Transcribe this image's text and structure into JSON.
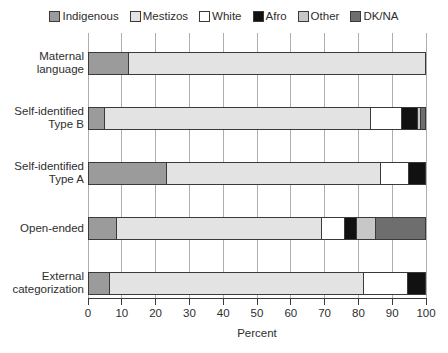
{
  "chart_data": {
    "type": "bar",
    "orientation": "horizontal",
    "stacked": true,
    "grid": "vertical",
    "legend_position": "top",
    "title": "",
    "xlabel": "Percent",
    "xlim": [
      0,
      100
    ],
    "xticks": [
      0,
      10,
      20,
      30,
      40,
      50,
      60,
      70,
      80,
      90,
      100
    ],
    "categories": [
      "Maternal\nlanguage",
      "Self-identified\nType B",
      "Self-identified\nType A",
      "Open-ended",
      "External\ncategorization"
    ],
    "series": [
      {
        "name": "Indigenous",
        "color": "#9b9b9b",
        "values": [
          11.5,
          4.5,
          23,
          8,
          6
        ]
      },
      {
        "name": "Mestizos",
        "color": "#e3e3e3",
        "values": [
          88.5,
          79,
          63.5,
          61,
          75.5
        ]
      },
      {
        "name": "White",
        "color": "#ffffff",
        "values": [
          0,
          9.5,
          8.5,
          7,
          13
        ]
      },
      {
        "name": "Afro",
        "color": "#111111",
        "values": [
          0,
          4.5,
          5,
          3.5,
          5.5
        ]
      },
      {
        "name": "Other",
        "color": "#c7c7c7",
        "values": [
          0,
          1,
          0,
          5.5,
          0
        ]
      },
      {
        "name": "DK/NA",
        "color": "#6e6e6e",
        "values": [
          0,
          1.5,
          0,
          15,
          0
        ]
      }
    ],
    "colors": {
      "bar_border": "#3a3a3a",
      "gridline": "#aeaeae",
      "axis": "#3a3a3a",
      "text": "#2e2e2e",
      "background": "#ffffff"
    }
  }
}
